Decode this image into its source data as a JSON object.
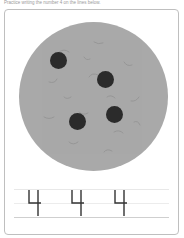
{
  "worksheet": {
    "instruction": "Practice writing the number 4 on the lines below.",
    "illustration": {
      "object": "cookie",
      "chip_count": 4,
      "cookie_color": "#a9a9a9",
      "chip_color": "#2b2b2b"
    },
    "tracing": {
      "number": "4",
      "repetitions": 3
    }
  }
}
